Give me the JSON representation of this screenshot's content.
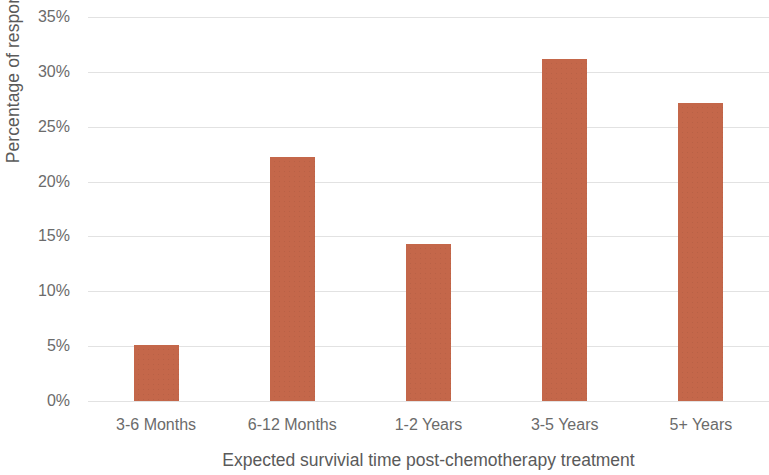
{
  "chart_data": {
    "type": "bar",
    "title": "",
    "xlabel": "Expected survivial time post-chemotherapy treatment",
    "ylabel": "Percentage of respondents",
    "categories": [
      "3-6 Months",
      "6-12 Months",
      "1-2 Years",
      "3-5 Years",
      "5+ Years"
    ],
    "values": [
      5.1,
      22.2,
      14.3,
      31.2,
      27.2
    ],
    "value_unit": "%",
    "ylim": [
      0,
      35
    ],
    "ytick_labels": [
      "35%",
      "30%",
      "25%",
      "20%",
      "15%",
      "10%",
      "5%",
      "0%"
    ],
    "ytick_values": [
      35,
      30,
      25,
      20,
      15,
      10,
      5,
      0
    ],
    "ytick_step": 5,
    "grid": true,
    "gridline_color": "#e2e2e2",
    "legend": false,
    "series": [
      {
        "name": "Percentage of respondents",
        "color": "#c4674a",
        "values": [
          5.1,
          22.2,
          14.3,
          31.2,
          27.2
        ]
      }
    ],
    "axis_label_color": "#5a5a5a",
    "tick_label_color": "#6b6b6b",
    "background_color": "#ffffff"
  }
}
